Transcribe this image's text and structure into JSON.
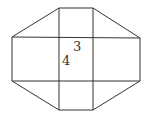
{
  "diagram": {
    "type": "octagon-net",
    "labels": [
      {
        "text": "3",
        "x": 77,
        "y": 50
      },
      {
        "text": "4",
        "x": 66,
        "y": 65
      }
    ],
    "stroke_color": "#333333",
    "outline": [
      [
        59,
        8
      ],
      [
        93,
        8
      ],
      [
        140,
        38
      ],
      [
        140,
        81
      ],
      [
        93,
        110
      ],
      [
        59,
        110
      ],
      [
        12,
        81
      ],
      [
        12,
        37
      ]
    ],
    "verticals": [
      59,
      93
    ],
    "horizontals": [
      37,
      81
    ]
  }
}
